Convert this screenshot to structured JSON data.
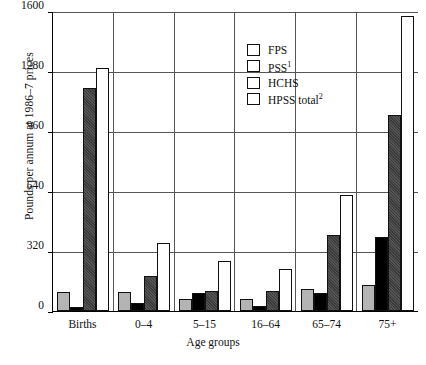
{
  "chart_data": {
    "type": "bar",
    "title": "",
    "xlabel": "Age groups",
    "ylabel": "Pounds per annum at 1986–7 prices",
    "categories": [
      "Births",
      "0–4",
      "5–15",
      "16–64",
      "65–74",
      "75+"
    ],
    "ylim": [
      0,
      1600
    ],
    "yticks": [
      0,
      320,
      640,
      960,
      1280,
      1600
    ],
    "ytick_labels": [
      "0",
      "320",
      "640",
      "960",
      "1280",
      "1600"
    ],
    "grid": true,
    "legend_position": "upper-center",
    "series": [
      {
        "name": "FPS",
        "key": "fps",
        "color": "#b4b4b4",
        "values": [
          100,
          100,
          65,
          65,
          115,
          140
        ]
      },
      {
        "name": "PSS",
        "key": "pss",
        "footnote": "1",
        "color": "#000000",
        "values": [
          20,
          45,
          95,
          25,
          95,
          395
        ]
      },
      {
        "name": "HCHS",
        "key": "hchs",
        "color": "#3a3a3a",
        "values": [
          1190,
          185,
          105,
          105,
          405,
          1045
        ]
      },
      {
        "name": "HPSS total",
        "key": "hpss",
        "footnote": "2",
        "color": "#ffffff",
        "values": [
          1295,
          365,
          265,
          225,
          620,
          1575
        ]
      }
    ]
  },
  "legend": {
    "items": [
      {
        "label": "FPS",
        "footnote": "",
        "swatch": "fps"
      },
      {
        "label": "PSS",
        "footnote": "1",
        "swatch": "pss"
      },
      {
        "label": "HCHS",
        "footnote": "",
        "swatch": "hchs"
      },
      {
        "label": "HPSS total",
        "footnote": "2",
        "swatch": "hpss"
      }
    ]
  },
  "caption": ""
}
